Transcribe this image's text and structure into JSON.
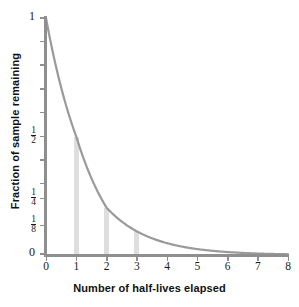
{
  "chart_data": {
    "type": "line",
    "title": "",
    "xlabel": "Number of half-lives elapsed",
    "ylabel": "Fraction of sample remaining",
    "xlim": [
      0,
      8
    ],
    "ylim": [
      0,
      1
    ],
    "grid": false,
    "legend": "none",
    "x_ticks": [
      "0",
      "1",
      "2",
      "3",
      "4",
      "5",
      "6",
      "7",
      "8"
    ],
    "x_tick_values": [
      0,
      1,
      2,
      3,
      4,
      5,
      6,
      7,
      8
    ],
    "y_ticks": [
      {
        "label": "1",
        "kind": "plain",
        "value": 1
      },
      {
        "label": "1/2",
        "kind": "fraction",
        "num": "1",
        "den": "2",
        "value": 0.5
      },
      {
        "label": "1/4",
        "kind": "fraction",
        "num": "1",
        "den": "4",
        "value": 0.25
      },
      {
        "label": "1/8",
        "kind": "fraction",
        "num": "1",
        "den": "8",
        "value": 0.125
      },
      {
        "label": "0",
        "kind": "plain",
        "value": 0
      }
    ],
    "y_tick_pixel_fractions": [
      0.0,
      0.5,
      0.8,
      0.9,
      1.0
    ],
    "y_minor_tick_pixel_fractions": [
      0.1,
      0.2,
      0.3,
      0.4,
      0.6,
      0.7
    ],
    "series": [
      {
        "name": "Fraction remaining",
        "formula": "y = (1/2)^x",
        "color": "#9a9a9a",
        "x": [
          0,
          0.25,
          0.5,
          0.75,
          1,
          1.25,
          1.5,
          1.75,
          2,
          2.25,
          2.5,
          2.75,
          3,
          3.25,
          3.5,
          3.75,
          4,
          4.5,
          5,
          5.5,
          6,
          6.5,
          7,
          7.5,
          8
        ],
        "values": [
          1,
          0.841,
          0.707,
          0.595,
          0.5,
          0.42,
          0.354,
          0.297,
          0.25,
          0.21,
          0.177,
          0.149,
          0.125,
          0.105,
          0.088,
          0.074,
          0.0625,
          0.044,
          0.031,
          0.022,
          0.0156,
          0.011,
          0.0078,
          0.0055,
          0.0039
        ]
      }
    ],
    "markers": {
      "name": "half-life guide bars",
      "color": "#dedede",
      "bars": [
        {
          "x": 1,
          "y_label": "1/2",
          "y": 0.5
        },
        {
          "x": 2,
          "y_label": "1/4",
          "y": 0.25
        },
        {
          "x": 3,
          "y_label": "1/8",
          "y": 0.125
        }
      ]
    },
    "colors": {
      "curve": "#9a9a9a",
      "axis": "#8f8f8f",
      "guide_bar": "#dedede",
      "text": "#1a1a1a",
      "background": "#ffffff"
    }
  }
}
